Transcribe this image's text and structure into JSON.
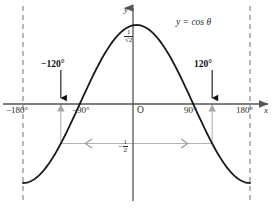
{
  "figure": {
    "curve_label": "y = cos θ",
    "origin_label": "O",
    "x_axis_label": "x",
    "y_axis_label": "y",
    "colors": {
      "curve": "#1a1a1a",
      "axis": "#555555",
      "dashed_guide": "#7d7d7d",
      "marker": "#9a9a9a",
      "arrow_black": "#111111",
      "text": "#2b2b2b"
    }
  },
  "axis": {
    "x_ticks": [
      {
        "label": "−180°",
        "value": -180
      },
      {
        "label": "−90°",
        "value": -90
      },
      {
        "label": "90°",
        "value": 90
      },
      {
        "label": "180°",
        "value": 180
      }
    ],
    "y_ticks": [
      {
        "label_num": "1",
        "label_den": "√2",
        "value": 0.7071
      },
      {
        "label_sign": "−",
        "label_num": "1",
        "label_den": "2",
        "value": -0.5
      }
    ]
  },
  "annotations": [
    {
      "label": "−120°",
      "value": -120,
      "arrow": "down"
    },
    {
      "label": "120°",
      "value": 120,
      "arrow": "down"
    }
  ],
  "chart_data": {
    "type": "line",
    "title": "y = cos θ",
    "xlabel": "x",
    "ylabel": "y",
    "xlim": [
      -180,
      180
    ],
    "ylim": [
      -1,
      1
    ],
    "grid": false,
    "legend": "none",
    "series": [
      {
        "name": "y = cos θ",
        "x": [
          -180,
          -165,
          -150,
          -135,
          -120,
          -105,
          -90,
          -75,
          -60,
          -45,
          -30,
          -15,
          0,
          15,
          30,
          45,
          60,
          75,
          90,
          105,
          120,
          135,
          150,
          165,
          180
        ],
        "y": [
          -1,
          -0.966,
          -0.866,
          -0.707,
          -0.5,
          -0.259,
          0,
          0.259,
          0.5,
          0.707,
          0.866,
          0.966,
          1,
          0.966,
          0.866,
          0.707,
          0.5,
          0.259,
          0,
          -0.259,
          -0.5,
          -0.707,
          -0.866,
          -0.966,
          -1
        ]
      }
    ],
    "horizontal_reference_line": {
      "y": -0.5,
      "label": "−1/2",
      "style": "solid-gray",
      "arrowheads": "both"
    },
    "vertical_dashed_lines": [
      -180,
      180
    ],
    "marked_points": [
      {
        "x": -120,
        "y": -0.5,
        "label": "−120°"
      },
      {
        "x": 120,
        "y": -0.5,
        "label": "120°"
      }
    ],
    "y_tick_labels": [
      "1/√2",
      "−1/2"
    ],
    "x_tick_labels": [
      "−180°",
      "−90°",
      "90°",
      "180°"
    ]
  }
}
